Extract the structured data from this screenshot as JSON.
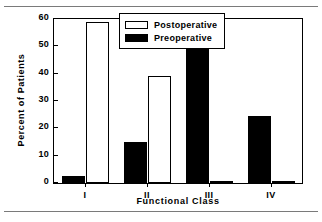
{
  "chart_data": {
    "type": "bar",
    "title": "",
    "xlabel": "Functional Class",
    "ylabel": "Percent of Patients",
    "categories": [
      "I",
      "II",
      "III",
      "IV"
    ],
    "ylim": [
      0,
      60
    ],
    "yticks": [
      0,
      10,
      20,
      30,
      40,
      50,
      60
    ],
    "ytick_labels": [
      "0",
      "10",
      "20",
      "30",
      "40",
      "50",
      "60"
    ],
    "grid": false,
    "legend_position": "top-right-inside",
    "series": [
      {
        "name": "Preoperative",
        "fill": "#000000",
        "values": [
          2.5,
          15,
          58,
          24.5
        ]
      },
      {
        "name": "Postoperative",
        "fill": "#ffffff",
        "values": [
          59,
          39,
          0.7,
          0.5
        ]
      }
    ],
    "legend": [
      {
        "label": "Postoperative",
        "swatch": "hollow"
      },
      {
        "label": "Preoperative",
        "swatch": "filled"
      }
    ]
  }
}
